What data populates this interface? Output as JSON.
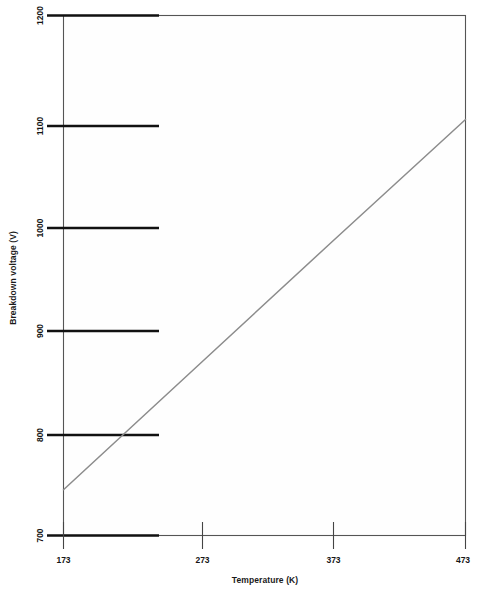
{
  "chart_data": {
    "type": "line",
    "title": "",
    "xlabel": "Temperature (K)",
    "ylabel": "Breakdown voltage (V)",
    "xlim": [
      173,
      473
    ],
    "ylim": [
      700,
      1200
    ],
    "xticks": [
      173,
      273,
      373,
      473
    ],
    "yticks": [
      700,
      800,
      900,
      1000,
      1100,
      1200
    ],
    "xtick_labels": [
      "173",
      "273",
      "373",
      "473"
    ],
    "ytick_labels": [
      "700",
      "800",
      "900",
      "1000",
      "1100",
      "1200"
    ],
    "grid": false,
    "legend": "none",
    "series": [
      {
        "name": "breakdown voltage",
        "color": "#8c8c8c",
        "x": [
          173,
          273,
          373,
          473
        ],
        "values": [
          744,
          863,
          982,
          1100
        ]
      }
    ],
    "annotations": []
  },
  "axes": {
    "y_title": "Breakdown voltage (V)",
    "x_title": "Temperature (K)"
  }
}
